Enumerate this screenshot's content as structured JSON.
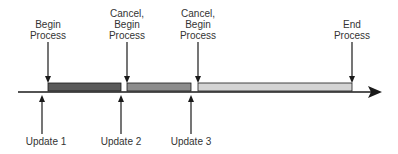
{
  "diagram": {
    "top_labels": [
      {
        "lines": [
          "Begin",
          "Process"
        ],
        "x": 48
      },
      {
        "lines": [
          "Cancel,",
          "Begin",
          "Process"
        ],
        "x": 127
      },
      {
        "lines": [
          "Cancel,",
          "Begin",
          "Process"
        ],
        "x": 198
      },
      {
        "lines": [
          "End",
          "Process"
        ],
        "x": 352
      }
    ],
    "bottom_labels": [
      {
        "text": "Update 1",
        "x": 42
      },
      {
        "text": "Update 2",
        "x": 121
      },
      {
        "text": "Update 3",
        "x": 191
      }
    ],
    "bars": [
      {
        "name": "process-1",
        "x1": 48,
        "x2": 121,
        "color": "#5a5a5a"
      },
      {
        "name": "process-2",
        "x1": 127,
        "x2": 191,
        "color": "#8c8c8c"
      },
      {
        "name": "process-3",
        "x1": 198,
        "x2": 352,
        "color": "#d4d4d4"
      }
    ],
    "colors": {
      "line": "#1a1a1a",
      "text": "#333333"
    }
  }
}
